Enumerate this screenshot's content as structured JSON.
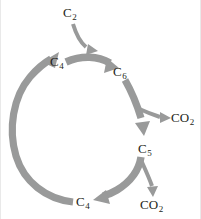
{
  "figure": {
    "background_color": "#ffffff",
    "arrow_color": "#999a9a",
    "label_color": "#231f20",
    "frame_color": "#e9e9e9",
    "width": 201,
    "height": 219
  },
  "labels": {
    "input_c2": {
      "formula": "C",
      "subscript": "2"
    },
    "top_c4": {
      "formula": "C",
      "subscript": "4"
    },
    "c6": {
      "formula": "C",
      "subscript": "6"
    },
    "co2_upper": {
      "formula": "CO",
      "subscript": "2"
    },
    "c5": {
      "formula": "C",
      "subscript": "5"
    },
    "co2_lower": {
      "formula": "CO",
      "subscript": "2"
    },
    "bottom_c4": {
      "formula": "C",
      "subscript": "4"
    }
  },
  "arrows": [
    {
      "name": "c2-to-cycle",
      "from": "input_c2",
      "to": "c4-to-c6-arrow",
      "style": "thin-curved"
    },
    {
      "name": "c4-to-c6",
      "from": "top_c4",
      "to": "c6",
      "style": "thick-arc"
    },
    {
      "name": "c6-to-c5",
      "from": "c6",
      "to": "c5",
      "style": "thick-arc"
    },
    {
      "name": "c6-to-co2",
      "from": "c6-to-c5-arrow",
      "to": "co2_upper",
      "style": "thin-branch"
    },
    {
      "name": "c5-to-c4",
      "from": "c5",
      "to": "bottom_c4",
      "style": "thick-arc"
    },
    {
      "name": "c5-to-co2",
      "from": "c5-to-c4-arrow",
      "to": "co2_lower",
      "style": "thin-branch"
    },
    {
      "name": "c4-to-c4-return",
      "from": "bottom_c4",
      "to": "top_c4",
      "style": "thick-arc"
    }
  ]
}
